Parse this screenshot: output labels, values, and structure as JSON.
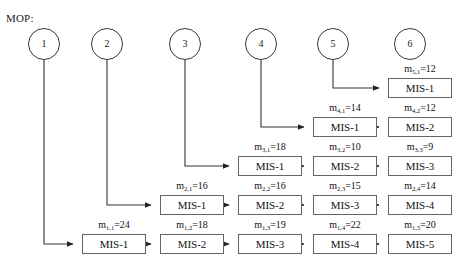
{
  "diagram": {
    "mop_label": "MOP:",
    "nodes": [
      {
        "id": "node-1",
        "label": "1",
        "cx": 44,
        "cy": 44
      },
      {
        "id": "node-2",
        "label": "2",
        "cx": 107,
        "cy": 44
      },
      {
        "id": "node-3",
        "label": "3",
        "cx": 185,
        "cy": 44
      },
      {
        "id": "node-4",
        "label": "4",
        "cx": 261,
        "cy": 44
      },
      {
        "id": "node-5",
        "label": "5",
        "cx": 333,
        "cy": 44
      },
      {
        "id": "node-6",
        "label": "6",
        "cx": 410,
        "cy": 44
      }
    ],
    "rows": [
      {
        "row_index": 5,
        "source_node": "5",
        "y": 78,
        "tasks": [
          {
            "box_label": "MIS-1",
            "m_prefix": "m",
            "m_sub": "5,1",
            "m_value": "12",
            "m_text": "m5,1=12",
            "col": 5
          }
        ]
      },
      {
        "row_index": 4,
        "source_node": "4",
        "y": 117,
        "tasks": [
          {
            "box_label": "MIS-1",
            "m_prefix": "m",
            "m_sub": "4,1",
            "m_value": "14",
            "m_text": "m4,1=14",
            "col": 4
          },
          {
            "box_label": "MIS-2",
            "m_prefix": "m",
            "m_sub": "4,2",
            "m_value": "12",
            "m_text": "m4,2=12",
            "col": 5
          }
        ]
      },
      {
        "row_index": 3,
        "source_node": "3",
        "y": 156,
        "tasks": [
          {
            "box_label": "MIS-1",
            "m_prefix": "m",
            "m_sub": "3,1",
            "m_value": "18",
            "m_text": "m3,1=18",
            "col": 3
          },
          {
            "box_label": "MIS-2",
            "m_prefix": "m",
            "m_sub": "3,2",
            "m_value": "10",
            "m_text": "m3,2=10",
            "col": 4
          },
          {
            "box_label": "MIS-3",
            "m_prefix": "m",
            "m_sub": "3,3",
            "m_value": "9",
            "m_text": "m3,3=9",
            "col": 5
          }
        ]
      },
      {
        "row_index": 2,
        "source_node": "2",
        "y": 195,
        "tasks": [
          {
            "box_label": "MIS-1",
            "m_prefix": "m",
            "m_sub": "2,1",
            "m_value": "16",
            "m_text": "m2,1=16",
            "col": 2
          },
          {
            "box_label": "MIS-2",
            "m_prefix": "m",
            "m_sub": "2,2",
            "m_value": "16",
            "m_text": "m2,2=16",
            "col": 3
          },
          {
            "box_label": "MIS-3",
            "m_prefix": "m",
            "m_sub": "2,3",
            "m_value": "15",
            "m_text": "m2,3=15",
            "col": 4
          },
          {
            "box_label": "MIS-4",
            "m_prefix": "m",
            "m_sub": "2,4",
            "m_value": "14",
            "m_text": "m2,4=14",
            "col": 5
          }
        ]
      },
      {
        "row_index": 1,
        "source_node": "1",
        "y": 234,
        "tasks": [
          {
            "box_label": "MIS-1",
            "m_prefix": "m",
            "m_sub": "1,1",
            "m_value": "24",
            "m_text": "m1,1=24",
            "col": 1
          },
          {
            "box_label": "MIS-2",
            "m_prefix": "m",
            "m_sub": "1,2",
            "m_value": "18",
            "m_text": "m1,2=18",
            "col": 2
          },
          {
            "box_label": "MIS-3",
            "m_prefix": "m",
            "m_sub": "1,3",
            "m_value": "19",
            "m_text": "m1,3=19",
            "col": 3
          },
          {
            "box_label": "MIS-4",
            "m_prefix": "m",
            "m_sub": "1,4",
            "m_value": "22",
            "m_text": "m1,4=22",
            "col": 4
          },
          {
            "box_label": "MIS-5",
            "m_prefix": "m",
            "m_sub": "1,5",
            "m_value": "20",
            "m_text": "m1,5=20",
            "col": 5
          }
        ]
      }
    ],
    "columns_x": [
      82,
      160,
      238,
      313,
      388
    ],
    "colors": {
      "line": "#333333",
      "box_border": "#666666",
      "circle_border": "#3a3a3a",
      "text": "#111111",
      "background": "#ffffff"
    }
  }
}
